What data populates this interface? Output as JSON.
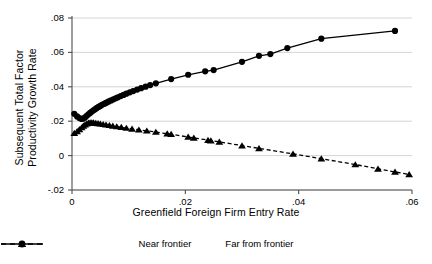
{
  "chart_data": {
    "type": "line",
    "title": "",
    "xlabel": "Greenfield Foreign Firm Entry Rate",
    "ylabel": "Subsequent Total Factor Productivity Growth Rate",
    "ylabel_line1": "Subsequent Total Factor",
    "ylabel_line2": "Productivity Growth Rate",
    "xlim": [
      0,
      0.06
    ],
    "ylim": [
      -0.02,
      0.08
    ],
    "xticks": [
      0,
      0.02,
      0.04,
      0.06
    ],
    "xtick_labels": [
      "0",
      ".02",
      ".04",
      ".06"
    ],
    "yticks": [
      -0.02,
      0,
      0.02,
      0.04,
      0.06,
      0.08
    ],
    "ytick_labels": [
      "-.02",
      "0",
      ".02",
      ".04",
      ".06",
      ".08"
    ],
    "grid": "horizontal",
    "legend_position": "bottom",
    "series": [
      {
        "name": "Near frontier",
        "marker": "circle",
        "linestyle": "solid",
        "color": "#000000",
        "x": [
          0.0004,
          0.0009,
          0.0013,
          0.0017,
          0.002,
          0.0023,
          0.0026,
          0.0029,
          0.0032,
          0.0035,
          0.0038,
          0.0041,
          0.0044,
          0.0047,
          0.005,
          0.0053,
          0.0056,
          0.0059,
          0.0062,
          0.0065,
          0.0069,
          0.0073,
          0.0077,
          0.0081,
          0.0086,
          0.0091,
          0.0096,
          0.0102,
          0.0108,
          0.0115,
          0.0122,
          0.013,
          0.0138,
          0.0148,
          0.0175,
          0.0205,
          0.0235,
          0.025,
          0.03,
          0.033,
          0.035,
          0.038,
          0.044,
          0.057
        ],
        "y": [
          0.0243,
          0.0228,
          0.0218,
          0.0213,
          0.0215,
          0.0222,
          0.0231,
          0.024,
          0.0248,
          0.0256,
          0.0263,
          0.027,
          0.0277,
          0.0283,
          0.0289,
          0.0295,
          0.03,
          0.0305,
          0.031,
          0.0315,
          0.0321,
          0.0327,
          0.0333,
          0.0339,
          0.0346,
          0.0353,
          0.036,
          0.0368,
          0.0375,
          0.0384,
          0.0392,
          0.0401,
          0.041,
          0.042,
          0.0445,
          0.047,
          0.049,
          0.0497,
          0.0545,
          0.058,
          0.059,
          0.0625,
          0.068,
          0.0725
        ]
      },
      {
        "name": "Far from frontier",
        "marker": "triangle",
        "linestyle": "dashed",
        "color": "#000000",
        "x": [
          0.0004,
          0.0009,
          0.0013,
          0.0017,
          0.002,
          0.0023,
          0.0026,
          0.0029,
          0.0032,
          0.0035,
          0.0038,
          0.0042,
          0.0046,
          0.005,
          0.0055,
          0.006,
          0.0066,
          0.0072,
          0.0079,
          0.0087,
          0.0096,
          0.0106,
          0.0118,
          0.0132,
          0.0148,
          0.0168,
          0.0175,
          0.0205,
          0.0215,
          0.024,
          0.0245,
          0.026,
          0.03,
          0.033,
          0.039,
          0.044,
          0.05,
          0.054,
          0.057,
          0.0595
        ],
        "y": [
          0.013,
          0.014,
          0.0152,
          0.0163,
          0.0173,
          0.018,
          0.0186,
          0.019,
          0.0192,
          0.0192,
          0.0191,
          0.0189,
          0.0187,
          0.0185,
          0.0182,
          0.0179,
          0.0176,
          0.0173,
          0.0169,
          0.0165,
          0.016,
          0.0155,
          0.015,
          0.0144,
          0.0137,
          0.0127,
          0.0124,
          0.0108,
          0.0103,
          0.009,
          0.0087,
          0.008,
          0.0058,
          0.0042,
          0.001,
          -0.0018,
          -0.0052,
          -0.0077,
          -0.0095,
          -0.011
        ]
      }
    ]
  },
  "legend": {
    "items": [
      {
        "label": "Near frontier",
        "marker": "circle",
        "linestyle": "solid"
      },
      {
        "label": "Far from frontier",
        "marker": "triangle",
        "linestyle": "dashed"
      }
    ]
  }
}
